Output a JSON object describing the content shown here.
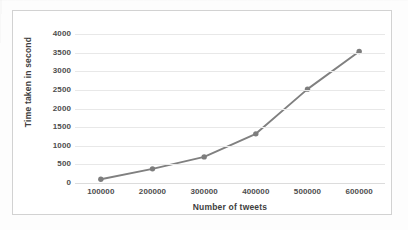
{
  "chart_data": {
    "type": "line",
    "title": "",
    "xlabel": "Number of tweets",
    "ylabel": "Time taken in second",
    "x": [
      100000,
      200000,
      300000,
      400000,
      500000,
      600000
    ],
    "categories": [
      "100000",
      "200000",
      "300000",
      "400000",
      "500000",
      "600000"
    ],
    "values": [
      100,
      380,
      700,
      1320,
      2520,
      3530
    ],
    "series": [
      {
        "name": "Time taken in second",
        "values": [
          100,
          380,
          700,
          1320,
          2520,
          3530
        ]
      }
    ],
    "ylim": [
      0,
      4000
    ],
    "yticks": [
      0,
      500,
      1000,
      1500,
      2000,
      2500,
      3000,
      3500,
      4000
    ],
    "ytick_labels": [
      "0",
      "500",
      "1000",
      "1500",
      "2000",
      "2500",
      "3000",
      "3500",
      "4000"
    ],
    "xtick_labels": [
      "100000",
      "200000",
      "300000",
      "400000",
      "500000",
      "600000"
    ],
    "grid": "horizontal",
    "legend": "none",
    "line_color": "#808080",
    "marker_color": "#7d7d7d",
    "marker": "circle",
    "gridline_color": "#e8e8e8",
    "frame_color": "#d2d2d2",
    "text_color": "#4d4d4d"
  }
}
